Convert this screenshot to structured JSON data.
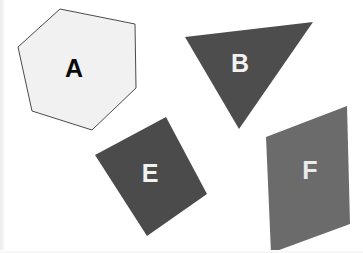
{
  "canvas": {
    "width": 363,
    "height": 253,
    "background_color": "#ffffff",
    "edge_tint_color": "#ededed"
  },
  "shapes": [
    {
      "id": "shape-a",
      "label": "A",
      "kind": "hexagon",
      "fill_color": "#f1f1f1",
      "stroke_color": "#4a4a4a",
      "stroke_width": 1,
      "label_color": "#0a0a0a",
      "label_x": 74,
      "label_y": 70,
      "points": "60,9 135,24 136,88 92,130 32,111 18,47"
    },
    {
      "id": "shape-b",
      "label": "B",
      "kind": "triangle",
      "fill_color": "#4d4d4d",
      "stroke_color": "#4d4d4d",
      "stroke_width": 0,
      "label_color": "#f2f2f2",
      "label_x": 240,
      "label_y": 65,
      "points": "185,37 313,22 239,129"
    },
    {
      "id": "shape-e",
      "label": "E",
      "kind": "square",
      "fill_color": "#4b4b4b",
      "stroke_color": "#4b4b4b",
      "stroke_width": 0,
      "label_color": "#f2f2f2",
      "label_x": 150,
      "label_y": 175,
      "points": "166,117 207,194 147,236 95,155"
    },
    {
      "id": "shape-f",
      "label": "F",
      "kind": "quadrilateral",
      "fill_color": "#6b6b6b",
      "stroke_color": "#6b6b6b",
      "stroke_width": 0,
      "label_color": "#ebebeb",
      "label_x": 310,
      "label_y": 172,
      "points": "347,106 350,224 271,253 266,137"
    }
  ]
}
